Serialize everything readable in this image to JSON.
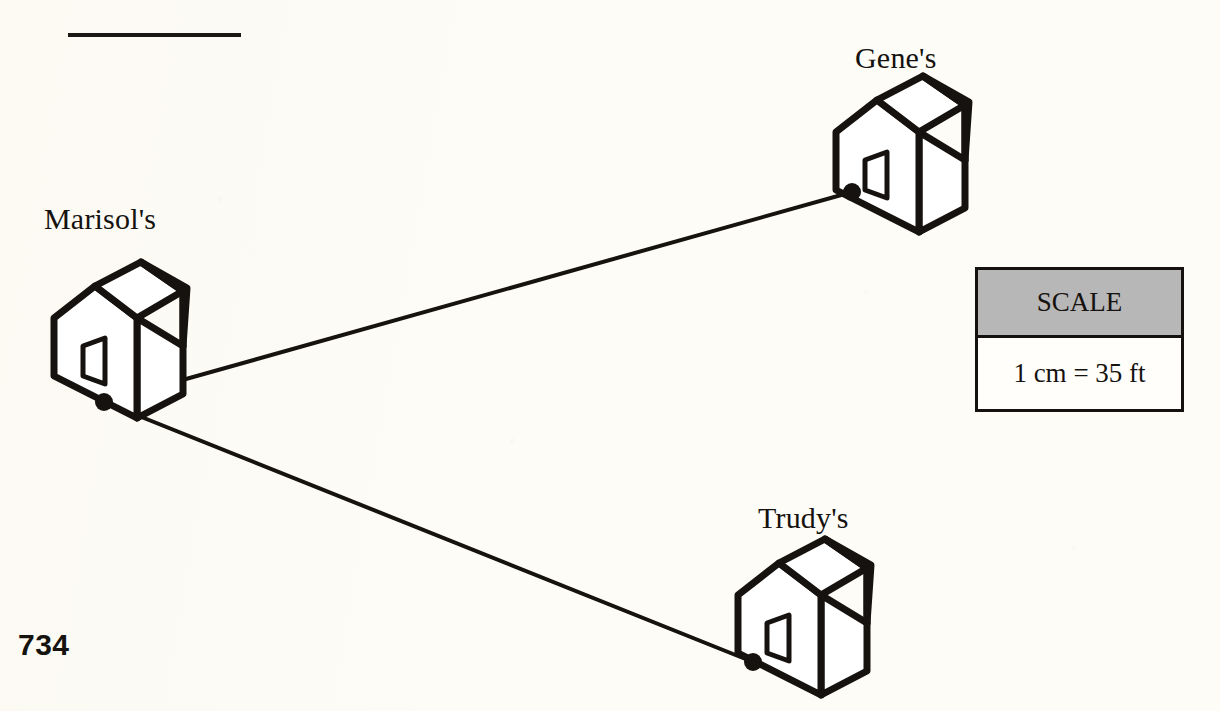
{
  "page": {
    "number": "734",
    "background_color": "#fdfcf7",
    "ink_color": "#15120f",
    "top_rule": "horizontal-rule"
  },
  "diagram": {
    "type": "scale-map",
    "houses": [
      {
        "id": "marisol",
        "label": "Marisol's",
        "label_position": {
          "x": 44,
          "y": 202
        },
        "house_origin": {
          "x": 38,
          "y": 258
        },
        "node": {
          "x": 104,
          "y": 402
        }
      },
      {
        "id": "gene",
        "label": "Gene's",
        "label_position": {
          "x": 855,
          "y": 41
        },
        "house_origin": {
          "x": 820,
          "y": 72
        },
        "node": {
          "x": 852,
          "y": 192
        }
      },
      {
        "id": "trudy",
        "label": "Trudy's",
        "label_position": {
          "x": 758,
          "y": 501
        },
        "house_origin": {
          "x": 722,
          "y": 535
        },
        "node": {
          "x": 753,
          "y": 662
        }
      }
    ],
    "segments": [
      {
        "id": "marisol-to-gene",
        "from": "marisol",
        "to": "gene",
        "from_point": {
          "x": 104,
          "y": 402
        },
        "to_point": {
          "x": 852,
          "y": 192
        }
      },
      {
        "id": "marisol-to-trudy",
        "from": "marisol",
        "to": "trudy",
        "from_point": {
          "x": 104,
          "y": 402
        },
        "to_point": {
          "x": 753,
          "y": 662
        }
      }
    ],
    "node_radius": 9
  },
  "scale_legend": {
    "title": "SCALE",
    "value": "1 cm = 35 ft",
    "header_color": "#b7b7b7",
    "border_color": "#14110e",
    "unit_from": "1 cm",
    "unit_to": "35 ft"
  }
}
